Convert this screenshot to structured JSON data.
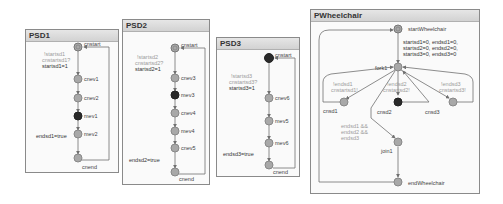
{
  "colors": {
    "state_fill": "#a8a8a8",
    "active_fill": "#2a2a2a",
    "edge": "#707070",
    "guard_text": "#9a9a9a",
    "label_text": "#444444"
  },
  "panels": [
    {
      "title": "PSD1",
      "states": [
        "cnstart",
        "cnev1",
        "cnev2",
        "mev1",
        "mev2",
        "cnend"
      ],
      "active_state": "mev1",
      "guard_lines": [
        "!startsd1",
        "cnstartsd1?"
      ],
      "action": "startsd1=1",
      "end_action": "endsd1=true"
    },
    {
      "title": "PSD2",
      "states": [
        "cnstart",
        "cnev3",
        "mev3",
        "cnev4",
        "mev4",
        "cnev5",
        "cnend"
      ],
      "active_state": "mev3",
      "guard_lines": [
        "!startsd2",
        "cnstartsd2?"
      ],
      "action": "startsd2=1",
      "end_action": "endsd2=true"
    },
    {
      "title": "PSD3",
      "states": [
        "cnstart",
        "cnev6",
        "mev5",
        "mev6",
        "cnend"
      ],
      "active_state": "cnstart",
      "guard_lines": [
        "!startsd3",
        "cnstartsd3?"
      ],
      "action": "startsd3=1",
      "end_action": "endsd3=true"
    }
  ],
  "wheelchair": {
    "title": "PWheelchair",
    "start_state": "startWheelchair",
    "init_actions": [
      "startsd1=0, endsd1=0,",
      "startsd2=0, endsd2=0,",
      "startsd3=0, endsd3=0"
    ],
    "fork": "fork1",
    "branches": [
      {
        "state": "cnsd1",
        "guard": [
          "!endsd1",
          "cnstartsd1!"
        ]
      },
      {
        "state": "cnsd2",
        "guard": [
          "!endsd2",
          "cnstartsd2!"
        ]
      },
      {
        "state": "cnsd3",
        "guard": [
          "!endsd3",
          "cnstartsd3!"
        ]
      }
    ],
    "active_state": "cnsd2",
    "join_guard": [
      "endsd1 &&",
      "endsd2 &&",
      "endsd3"
    ],
    "join": "join1",
    "end_state": "endWheelchair"
  }
}
